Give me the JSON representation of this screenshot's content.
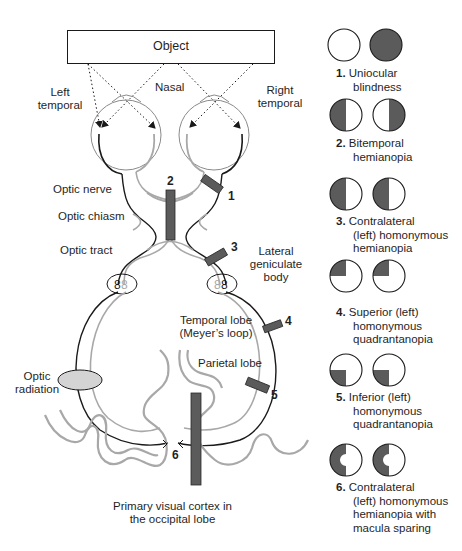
{
  "diagram": {
    "object_label": "Object",
    "labels": {
      "left_temporal": [
        "Left",
        "temporal"
      ],
      "nasal": "Nasal",
      "right_temporal": [
        "Right",
        "temporal"
      ],
      "optic_nerve": "Optic nerve",
      "optic_chiasm": "Optic chiasm",
      "optic_tract": "Optic tract",
      "lateral_geniculate_body": [
        "Lateral",
        "geniculate",
        "body"
      ],
      "temporal_lobe": [
        "Temporal lobe",
        "(Meyer’s loop)"
      ],
      "parietal_lobe": "Parietal lobe",
      "optic_radiation": [
        "Optic",
        "radiation"
      ],
      "primary_visual_cortex": [
        "Primary visual cortex in",
        "the occipital lobe"
      ]
    },
    "lesion_markers": [
      "1",
      "2",
      "3",
      "4",
      "5",
      "6"
    ],
    "colors": {
      "lesion_fill": "#5a5a5a",
      "left_pathway": "#1a1a1a",
      "right_pathway": "#a8a8a8",
      "optic_radiation_fill": "#d4d4d4",
      "field_defect": "#5a5a5a"
    }
  },
  "legend": {
    "items": [
      {
        "number": "1.",
        "lines": [
          "Uniocular",
          "blindness"
        ],
        "left_field": "clear",
        "right_field": "full"
      },
      {
        "number": "2.",
        "lines": [
          "Bitemporal",
          "hemianopia"
        ],
        "left_field": "left-half",
        "right_field": "right-half"
      },
      {
        "number": "3.",
        "lines": [
          "Contralateral",
          "(left) homonymous",
          "hemianopia"
        ],
        "left_field": "left-half",
        "right_field": "left-half"
      },
      {
        "number": "4.",
        "lines": [
          "Superior (left)",
          "homonymous",
          "quadrantanopia"
        ],
        "left_field": "upper-left-quadrant",
        "right_field": "upper-left-quadrant"
      },
      {
        "number": "5.",
        "lines": [
          "Inferior (left)",
          "homonymous",
          "quadrantanopia"
        ],
        "left_field": "lower-left-quadrant",
        "right_field": "lower-left-quadrant"
      },
      {
        "number": "6.",
        "lines": [
          "Contralateral",
          "(left) homonymous",
          "hemianopia with",
          "macula sparing"
        ],
        "left_field": "left-half-macula-spared",
        "right_field": "left-half-macula-spared"
      }
    ]
  }
}
